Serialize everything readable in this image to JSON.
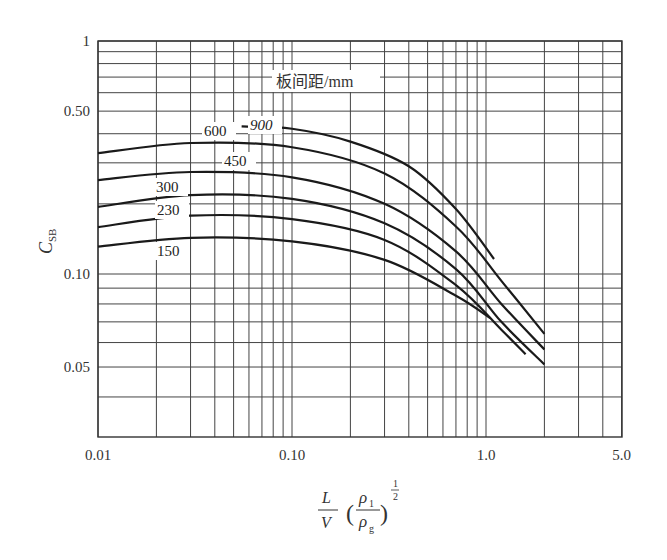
{
  "chart_data": {
    "type": "line",
    "title": "",
    "xlabel": "L/V (ρ1/ρg)^(1/2)",
    "ylabel": "C_SB",
    "xscale": "log",
    "yscale": "log",
    "xlim": [
      0.01,
      5.0
    ],
    "ylim": [
      0.03,
      1.0
    ],
    "grid": true,
    "x_tick_labels": [
      "0.01",
      "0.10",
      "1.0",
      "5.0"
    ],
    "y_tick_labels": [
      "1",
      "0.50",
      "0.10",
      "0.05"
    ],
    "legend_title": "板间距/mm",
    "series": [
      {
        "name": "900",
        "x": [
          0.055,
          0.1,
          0.2,
          0.4,
          0.7,
          1.1
        ],
        "values": [
          0.43,
          0.42,
          0.37,
          0.29,
          0.19,
          0.116
        ]
      },
      {
        "name": "600",
        "x": [
          0.01,
          0.03,
          0.1,
          0.3,
          0.7,
          1.2,
          2.0
        ],
        "values": [
          0.33,
          0.365,
          0.35,
          0.27,
          0.16,
          0.095,
          0.064
        ]
      },
      {
        "name": "450",
        "x": [
          0.01,
          0.03,
          0.1,
          0.3,
          0.7,
          1.2,
          2.0
        ],
        "values": [
          0.253,
          0.274,
          0.26,
          0.2,
          0.125,
          0.08,
          0.057
        ]
      },
      {
        "name": "300",
        "x": [
          0.01,
          0.03,
          0.1,
          0.3,
          0.7,
          1.2,
          2.0
        ],
        "values": [
          0.194,
          0.218,
          0.21,
          0.165,
          0.105,
          0.07,
          0.051
        ]
      },
      {
        "name": "230",
        "x": [
          0.01,
          0.03,
          0.1,
          0.3,
          0.7,
          1.2,
          1.6
        ],
        "values": [
          0.159,
          0.178,
          0.172,
          0.14,
          0.092,
          0.066,
          0.055
        ]
      },
      {
        "name": "150",
        "x": [
          0.01,
          0.03,
          0.1,
          0.3,
          0.7,
          1.05
        ],
        "values": [
          0.131,
          0.143,
          0.138,
          0.115,
          0.085,
          0.072
        ]
      }
    ]
  },
  "labels": {
    "y_axis_main": "C",
    "y_axis_sub": "SB",
    "legend_title": "板间距/mm",
    "x_axis": {
      "num_top": "L",
      "num_bottom": "V",
      "rho_top": "ρ",
      "rho_top_sub": "1",
      "rho_bottom": "ρ",
      "rho_bottom_sub": "g",
      "exp_num": "1",
      "exp_den": "2"
    }
  }
}
